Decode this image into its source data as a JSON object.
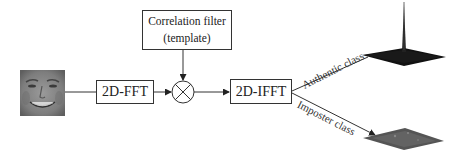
{
  "diagram": {
    "type": "block-diagram",
    "nodes": {
      "input_image": {
        "label": "",
        "kind": "face-image"
      },
      "fft": {
        "label": "2D-FFT"
      },
      "correlation_filter": {
        "line1": "Correlation filter",
        "line2": "(template)"
      },
      "multiplier": {
        "symbol": "⊗",
        "kind": "multiplication-node"
      },
      "ifft": {
        "label": "2D-IFFT"
      },
      "authentic_output": {
        "kind": "correlation-plane-sharp-peak"
      },
      "imposter_output": {
        "kind": "correlation-plane-flat"
      }
    },
    "edges": [
      {
        "from": "input_image",
        "to": "fft"
      },
      {
        "from": "fft",
        "to": "multiplier"
      },
      {
        "from": "correlation_filter",
        "to": "multiplier"
      },
      {
        "from": "multiplier",
        "to": "ifft"
      },
      {
        "from": "ifft",
        "to": "authentic_output",
        "label": "Authentic class"
      },
      {
        "from": "ifft",
        "to": "imposter_output",
        "label": "Imposter class"
      }
    ],
    "labels": {
      "authentic": "Authentic class",
      "imposter": "Imposter class"
    },
    "colors": {
      "line": "#333333",
      "authentic_surface": "#111111",
      "imposter_surface": "#555555",
      "face_tone": "#8a8a8a"
    }
  }
}
